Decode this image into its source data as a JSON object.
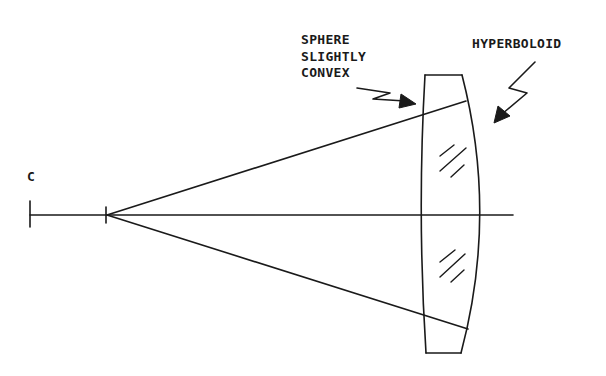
{
  "diagram": {
    "type": "optical lens ray diagram",
    "labels": {
      "center": "C",
      "front_surface": [
        "SPHERE",
        "SLIGHTLY",
        "CONVEX"
      ],
      "rear_surface": "HYPERBOLOID"
    },
    "elements": {
      "optical_axis": "horizontal line through center C",
      "focal_point": "tick mark on axis where rays originate",
      "rays": [
        "upper marginal ray",
        "lower marginal ray"
      ],
      "lens": "thick lens with slightly convex spherical front surface and hyperboloid rear surface",
      "glass_hatching": [
        "upper hatch marks",
        "lower hatch marks"
      ]
    },
    "colors": {
      "line": "#1a1a1a",
      "background": "#ffffff"
    }
  }
}
